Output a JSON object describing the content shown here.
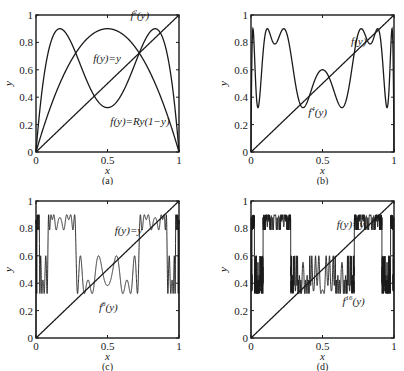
{
  "figure": {
    "parameter_R": 3.6,
    "line_color": "#1a1a1a",
    "background": "#ffffff"
  },
  "chart_data": [
    {
      "id": "a",
      "type": "line",
      "caption": "(a)",
      "xlabel": "x",
      "ylabel": "y",
      "xlim": [
        0,
        1
      ],
      "ylim": [
        0,
        1
      ],
      "xticks": [
        "0",
        "0.5",
        "1"
      ],
      "yticks": [
        "0",
        "0.2",
        "0.4",
        "0.6",
        "0.8",
        "1"
      ],
      "grid": false,
      "series": [
        {
          "name": "f(y)=y",
          "function": "identity",
          "iterate": 0
        },
        {
          "name": "f(y)=Ry(1−y)",
          "function": "logistic",
          "iterate": 1,
          "R": 3.6,
          "peak": 0.9
        },
        {
          "name": "f²(y)",
          "function": "logistic",
          "iterate": 2,
          "R": 3.6,
          "min_at_0.5": 0.32,
          "peaks": 0.9
        }
      ],
      "annotations": [
        {
          "text": "f",
          "sup": "2",
          "suffix": "(y)",
          "x": 0.66,
          "y": 0.97
        },
        {
          "text": "f(y)=y",
          "x": 0.4,
          "y": 0.66
        },
        {
          "text": "f(y)=Ry(1−y)",
          "x": 0.52,
          "y": 0.2
        }
      ]
    },
    {
      "id": "b",
      "type": "line",
      "caption": "(b)",
      "xlabel": "x",
      "ylabel": "y",
      "xlim": [
        0,
        1
      ],
      "ylim": [
        0,
        1
      ],
      "xticks": [
        "0",
        "0.5",
        "1"
      ],
      "yticks": [
        "0",
        "0.2",
        "0.4",
        "0.6",
        "0.8",
        "1"
      ],
      "grid": false,
      "series": [
        {
          "name": "f(y)",
          "function": "identity",
          "iterate": 0
        },
        {
          "name": "f⁴(y)",
          "function": "logistic",
          "iterate": 4,
          "R": 3.6,
          "range": [
            0.32,
            0.9
          ]
        }
      ],
      "annotations": [
        {
          "text": "f(y)",
          "x": 0.7,
          "y": 0.78
        },
        {
          "text": "f",
          "sup": "4",
          "suffix": "(y)",
          "x": 0.4,
          "y": 0.26
        }
      ]
    },
    {
      "id": "c",
      "type": "line",
      "caption": "(c)",
      "xlabel": "x",
      "ylabel": "y",
      "xlim": [
        0,
        1
      ],
      "ylim": [
        0,
        1
      ],
      "xticks": [
        "0",
        "0.5",
        "1"
      ],
      "yticks": [
        "0",
        "0.2",
        "0.4",
        "0.6",
        "0.8",
        "1"
      ],
      "grid": false,
      "series": [
        {
          "name": "f(y)=y",
          "function": "identity",
          "iterate": 0
        },
        {
          "name": "f⁸(y)",
          "function": "logistic",
          "iterate": 8,
          "R": 3.6,
          "range": [
            0.32,
            0.9
          ]
        }
      ],
      "annotations": [
        {
          "text": "f(y)=y",
          "x": 0.55,
          "y": 0.76
        },
        {
          "text": "f",
          "sup": "8",
          "suffix": "(y)",
          "x": 0.44,
          "y": 0.2
        }
      ]
    },
    {
      "id": "d",
      "type": "line",
      "caption": "(d)",
      "xlabel": "x",
      "ylabel": "y",
      "xlim": [
        0,
        1
      ],
      "ylim": [
        0,
        1
      ],
      "xticks": [
        "0",
        "0.5",
        "1"
      ],
      "yticks": [
        "0",
        "0.2",
        "0.4",
        "0.6",
        "0.8",
        "1"
      ],
      "grid": false,
      "series": [
        {
          "name": "f(y)=y",
          "function": "identity",
          "iterate": 0
        },
        {
          "name": "f¹⁶(y)",
          "function": "logistic",
          "iterate": 16,
          "R": 3.6,
          "range": [
            0.32,
            0.9
          ]
        }
      ],
      "annotations": [
        {
          "text": "f(y)=y",
          "x": 0.6,
          "y": 0.8
        },
        {
          "text": "f",
          "sup": "16",
          "suffix": "(y)",
          "x": 0.64,
          "y": 0.24
        }
      ]
    }
  ]
}
